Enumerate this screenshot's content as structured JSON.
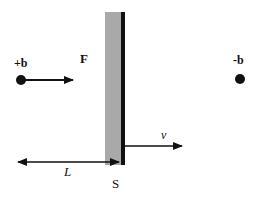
{
  "diagram": {
    "labels": {
      "plus_b": "+b",
      "minus_b": "-b",
      "force": "F",
      "velocity": "v",
      "distance": "L",
      "surface": "S"
    },
    "colors": {
      "plate_fill": "#a9a9a9",
      "plate_edge": "#111111",
      "ink": "#111111"
    }
  }
}
